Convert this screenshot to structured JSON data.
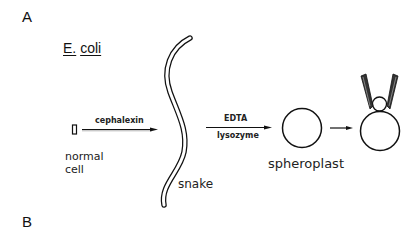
{
  "panels": {
    "a_label": "A",
    "b_label": "B"
  },
  "organism": {
    "genus": "E.",
    "species": "coli"
  },
  "stages": {
    "normal_cell": {
      "line1": "normal",
      "line2": "cell"
    },
    "snake": "snake",
    "spheroplast": "spheroplast"
  },
  "arrows": {
    "step1_label": "cephalexin",
    "step2_label_top": "EDTA",
    "step2_label_bottom": "lysozyme"
  },
  "icons": {
    "normal_cell": "rod-cell-shape",
    "snake": "elongated-filament-shape",
    "spheroplast": "circle-shape",
    "patch": "patch-clamp-pipette-on-spheroplast"
  },
  "colors": {
    "line": "#111111",
    "background": "#ffffff"
  }
}
